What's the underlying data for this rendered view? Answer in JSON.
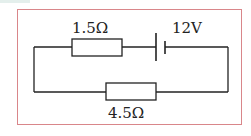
{
  "diagram": {
    "type": "circuit",
    "components": [
      {
        "kind": "resistor",
        "label": "1.5Ω",
        "position": "top-left branch"
      },
      {
        "kind": "battery",
        "label": "12V",
        "position": "top-right branch"
      },
      {
        "kind": "resistor",
        "label": "4.5Ω",
        "position": "bottom branch"
      }
    ],
    "labels": {
      "r1": "1.5Ω",
      "battery": "12V",
      "r2": "4.5Ω"
    },
    "colors": {
      "frame": "#d9868a",
      "wire": "#222222",
      "background": "#ffffff"
    }
  }
}
